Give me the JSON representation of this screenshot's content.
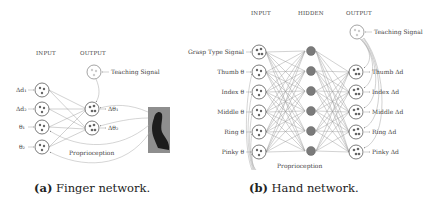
{
  "finger_network": {
    "headers": {
      "input": "INPUT",
      "output": "OUTPUT"
    },
    "teaching_signal": "Teaching Signal",
    "inputs": [
      "Δd₁",
      "Δd₂",
      "θ₁",
      "θ₂"
    ],
    "outputs": [
      "Δθ₁",
      "Δθ₂"
    ],
    "feedback_label": "Proprioception",
    "caption_label": "(a)",
    "caption_text": "Finger network."
  },
  "hand_network": {
    "headers": {
      "input": "INPUT",
      "hidden": "HIDDEN",
      "output": "OUTPUT"
    },
    "teaching_signal": "Teaching Signal",
    "inputs": [
      "Grasp Type Signal",
      "Thumb θ",
      "Index θ",
      "Middle θ",
      "Ring θ",
      "Pinky θ"
    ],
    "outputs": [
      "Thumb Δd",
      "Index Δd",
      "Middle Δd",
      "Ring Δd",
      "Pinky Δd"
    ],
    "hidden_count": 6,
    "feedback_label": "Proprioception",
    "caption_label": "(b)",
    "caption_text": "Hand network."
  }
}
